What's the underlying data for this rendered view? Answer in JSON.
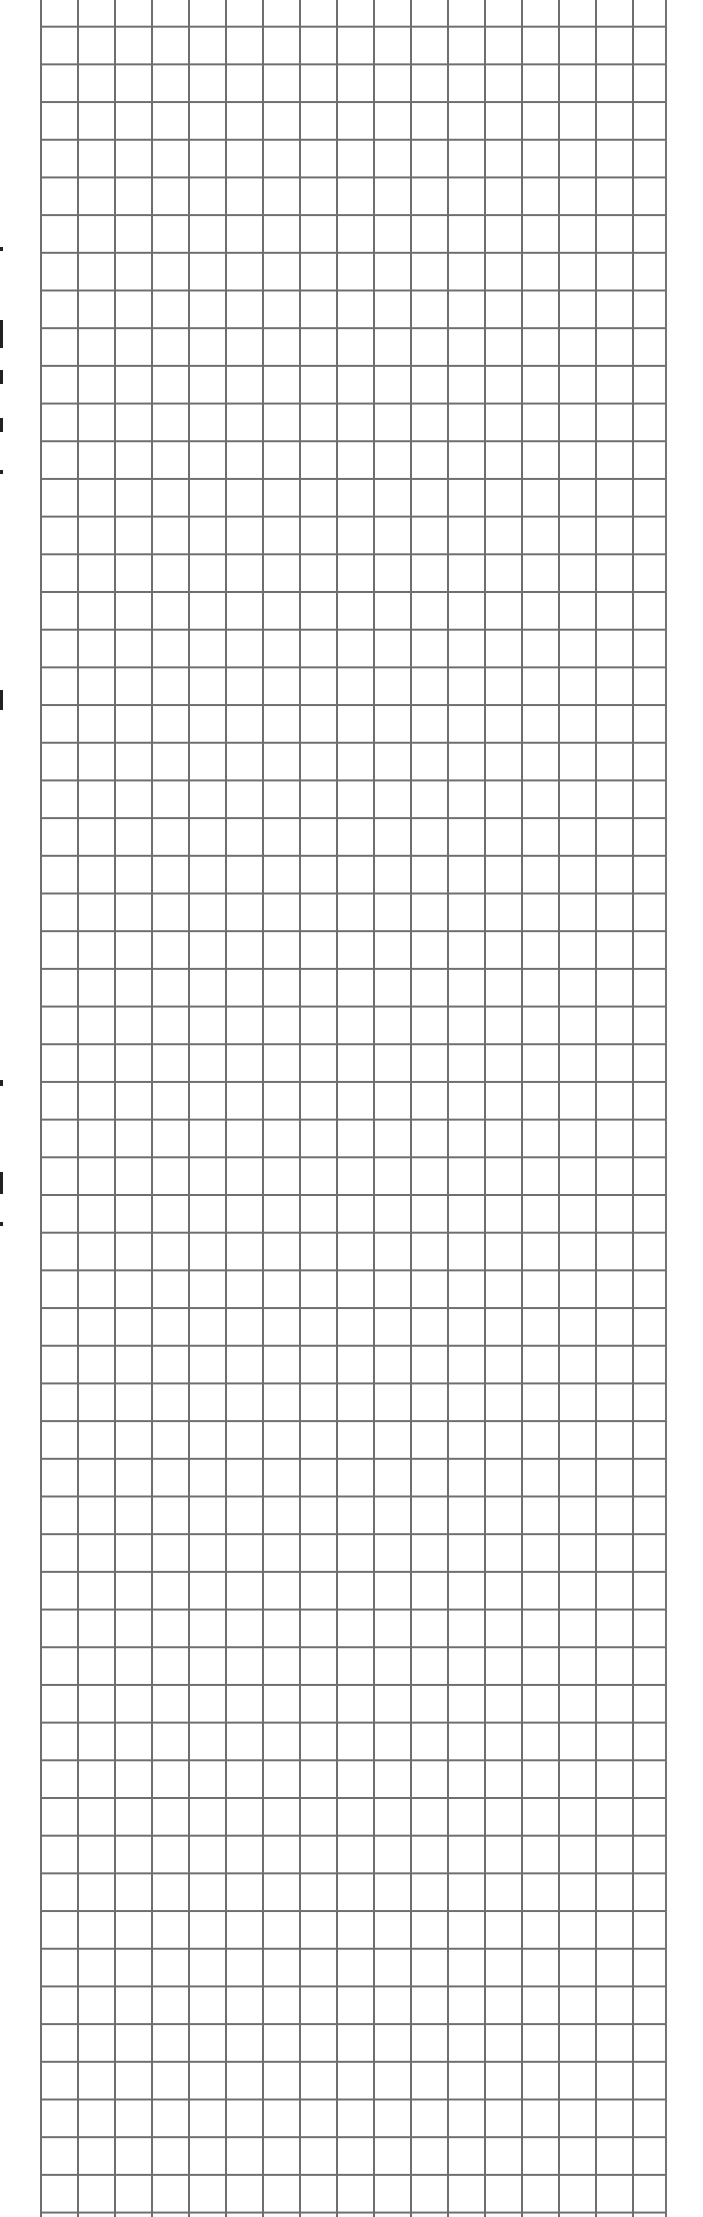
{
  "document": {
    "type": "graph-paper-scan",
    "grid_color": "#6e6e6e",
    "background_color": "#ffffff",
    "left_margin_marks": [
      {
        "y": 247,
        "h": 4
      },
      {
        "y": 320,
        "h": 28
      },
      {
        "y": 370,
        "h": 14
      },
      {
        "y": 418,
        "h": 14
      },
      {
        "y": 470,
        "h": 4
      },
      {
        "y": 690,
        "h": 20
      },
      {
        "y": 1080,
        "h": 6
      },
      {
        "y": 1172,
        "h": 22
      },
      {
        "y": 1222,
        "h": 4
      }
    ]
  }
}
